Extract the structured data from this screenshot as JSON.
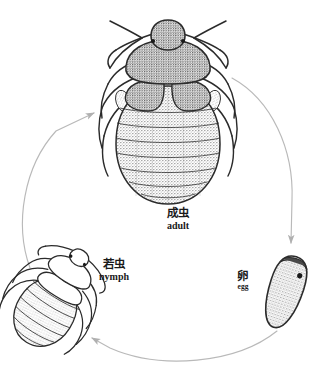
{
  "diagram": {
    "background_color": "#ffffff",
    "ink_color": "#1a1a1a",
    "arrow_color": "#b9b9b9",
    "stages": [
      {
        "id": "adult",
        "label_cn": "成虫",
        "label_en": "adult"
      },
      {
        "id": "nymph",
        "label_cn": "若虫",
        "label_en": "nymph"
      },
      {
        "id": "egg",
        "label_cn": "卵",
        "label_en": "egg"
      }
    ],
    "arrows": [
      {
        "id": "adult-to-egg",
        "from": "adult",
        "to": "egg"
      },
      {
        "id": "egg-to-nymph",
        "from": "egg",
        "to": "nymph"
      },
      {
        "id": "nymph-to-adult",
        "from": "nymph",
        "to": "adult"
      }
    ]
  }
}
